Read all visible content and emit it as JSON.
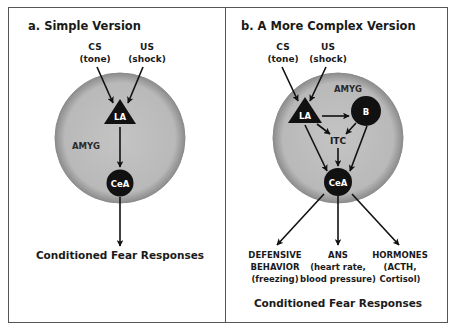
{
  "colors": {
    "background": "#ffffff",
    "border": "#555555",
    "amygdala_fill": "#bdbdbd",
    "amygdala_edge": "#8a8a8a",
    "node_fill": "#111111",
    "node_text": "#ffffff",
    "arrow": "#111111"
  },
  "panel_a": {
    "title": "a. Simple Version",
    "inputs": [
      {
        "name": "CS",
        "detail": "(tone)"
      },
      {
        "name": "US",
        "detail": "(shock)"
      }
    ],
    "region_label": "AMYG",
    "nodes": [
      {
        "id": "LA",
        "label": "LA",
        "shape": "triangle"
      },
      {
        "id": "CeA",
        "label": "CeA",
        "shape": "circle"
      }
    ],
    "edges": [
      [
        "CS",
        "LA"
      ],
      [
        "US",
        "LA"
      ],
      [
        "LA",
        "CeA"
      ],
      [
        "CeA",
        "output"
      ]
    ],
    "output": "Conditioned Fear Responses"
  },
  "panel_b": {
    "title": "b. A More Complex Version",
    "inputs": [
      {
        "name": "CS",
        "detail": "(tone)"
      },
      {
        "name": "US",
        "detail": "(shock)"
      }
    ],
    "region_label": "AMYG",
    "nodes": [
      {
        "id": "LA",
        "label": "LA",
        "shape": "triangle"
      },
      {
        "id": "B",
        "label": "B",
        "shape": "circle"
      },
      {
        "id": "ITC",
        "label": "ITC",
        "shape": "text"
      },
      {
        "id": "CeA",
        "label": "CeA",
        "shape": "circle"
      }
    ],
    "edges": [
      [
        "CS",
        "LA"
      ],
      [
        "US",
        "LA"
      ],
      [
        "LA",
        "B"
      ],
      [
        "LA",
        "ITC"
      ],
      [
        "B",
        "ITC"
      ],
      [
        "LA",
        "CeA"
      ],
      [
        "B",
        "CeA"
      ],
      [
        "ITC",
        "CeA"
      ],
      [
        "CeA",
        "DEFENSIVE BEHAVIOR"
      ],
      [
        "CeA",
        "ANS"
      ],
      [
        "CeA",
        "HORMONES"
      ]
    ],
    "outputs": [
      {
        "lines": [
          "DEFENSIVE",
          "BEHAVIOR",
          "(freezing)"
        ]
      },
      {
        "lines": [
          "ANS",
          "(heart rate,",
          "blood pressure)"
        ]
      },
      {
        "lines": [
          "HORMONES",
          "(ACTH,",
          "Cortisol)"
        ]
      }
    ],
    "footer": "Conditioned Fear Responses"
  }
}
